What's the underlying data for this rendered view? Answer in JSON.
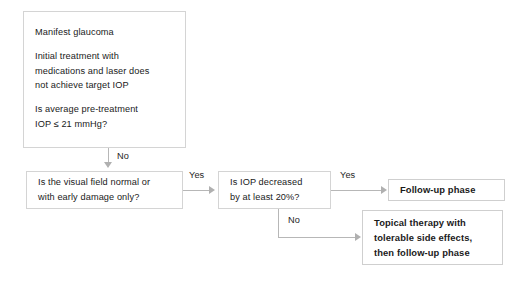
{
  "diagram": {
    "background_color": "#ffffff",
    "box_border_color": "#d4d4d4",
    "connector_color": "#b7b7b7",
    "text_color": "#1a1a1a"
  },
  "nodes": {
    "manifest": {
      "name": "manifest-glaucoma",
      "lines": [
        "Manifest glaucoma",
        "",
        "Initial treatment with",
        "medications and laser does",
        "not achieve target IOP",
        "",
        "Is average pre-treatment",
        "IOP ≤ 21 mmHg?"
      ]
    },
    "visual_field": {
      "name": "visual-field-question",
      "lines": [
        "Is the visual field normal or",
        "with early damage only?"
      ]
    },
    "iop_decreased": {
      "name": "iop-decreased-question",
      "lines": [
        "Is IOP decreased",
        "by at least 20%?"
      ]
    },
    "followup": {
      "name": "follow-up-phase",
      "lines": [
        "Follow-up phase"
      ]
    },
    "topical": {
      "name": "topical-therapy",
      "lines": [
        "Topical therapy with",
        "tolerable side effects,",
        "then follow-up phase"
      ]
    }
  },
  "edges": {
    "manifest_no": "No",
    "visual_field_yes": "Yes",
    "iop_yes": "Yes",
    "iop_no": "No"
  }
}
